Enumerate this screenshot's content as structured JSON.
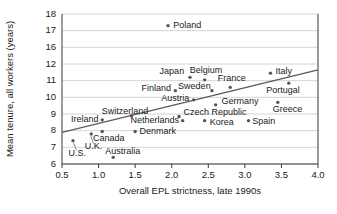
{
  "chart_data": {
    "type": "scatter",
    "title": "",
    "xlabel": "Overall EPL strictness, late 1990s",
    "ylabel": "Mean tenure, all workers (years)",
    "xlim": [
      0.5,
      4.0
    ],
    "xticks": [
      "0.5",
      "1.0",
      "1.5",
      "2.0",
      "2.5",
      "3.0",
      "3.5",
      "4.0"
    ],
    "yticks": [
      "6",
      "7",
      "8",
      "9",
      "10",
      "11",
      "12",
      "16",
      "17",
      "18"
    ],
    "y_axis_break": "between 12 and 16",
    "grid": "horizontal",
    "legend": "none",
    "point_color": "#55555f",
    "trend_color": "#5a5a66",
    "trendline": {
      "x_start": 0.5,
      "y_start": 7.9,
      "x_end": 4.0,
      "y_end": 11.65
    },
    "points": [
      {
        "label": "Poland",
        "x": 1.95,
        "y": 17.3
      },
      {
        "label": "Italy",
        "x": 3.35,
        "y": 11.45
      },
      {
        "label": "Japan",
        "x": 2.25,
        "y": 11.2
      },
      {
        "label": "Belgium",
        "x": 2.45,
        "y": 11.05
      },
      {
        "label": "Portugal",
        "x": 3.6,
        "y": 10.85
      },
      {
        "label": "France",
        "x": 2.8,
        "y": 10.6
      },
      {
        "label": "Sweden",
        "x": 2.55,
        "y": 10.4
      },
      {
        "label": "Finland",
        "x": 2.05,
        "y": 10.4
      },
      {
        "label": "Austria",
        "x": 2.3,
        "y": 9.85
      },
      {
        "label": "Greece",
        "x": 3.45,
        "y": 9.7
      },
      {
        "label": "Germany",
        "x": 2.6,
        "y": 9.55
      },
      {
        "label": "Switzerland",
        "x": 1.45,
        "y": 8.9
      },
      {
        "label": "Czech Republic",
        "x": 2.1,
        "y": 8.85
      },
      {
        "label": "Netherlands",
        "x": 2.15,
        "y": 8.6
      },
      {
        "label": "Ireland",
        "x": 1.05,
        "y": 8.65
      },
      {
        "label": "Korea",
        "x": 2.45,
        "y": 8.6
      },
      {
        "label": "Spain",
        "x": 3.05,
        "y": 8.6
      },
      {
        "label": "Denmark",
        "x": 1.5,
        "y": 7.95
      },
      {
        "label": "Canada",
        "x": 1.05,
        "y": 7.95
      },
      {
        "label": "U.K.",
        "x": 0.9,
        "y": 7.8
      },
      {
        "label": "U.S.",
        "x": 0.65,
        "y": 7.4
      },
      {
        "label": "Australia",
        "x": 1.2,
        "y": 6.4
      }
    ],
    "labels": [
      {
        "text": "Poland",
        "x": 2.02,
        "y": 17.3,
        "anchor": "start"
      },
      {
        "text": "Italy",
        "x": 3.42,
        "y": 11.55,
        "anchor": "start"
      },
      {
        "text": "Japan",
        "x": 2.17,
        "y": 11.55,
        "anchor": "end"
      },
      {
        "text": "Belgium",
        "x": 2.47,
        "y": 11.6,
        "anchor": "middle"
      },
      {
        "text": "France",
        "x": 2.82,
        "y": 11.1,
        "anchor": "middle"
      },
      {
        "text": "Portugal",
        "x": 3.52,
        "y": 10.4,
        "anchor": "middle"
      },
      {
        "text": "Sweden",
        "x": 2.31,
        "y": 10.65,
        "anchor": "middle"
      },
      {
        "text": "Finland",
        "x": 1.99,
        "y": 10.5,
        "anchor": "end"
      },
      {
        "text": "Austria",
        "x": 2.24,
        "y": 9.95,
        "anchor": "end"
      },
      {
        "text": "Germany",
        "x": 2.68,
        "y": 9.75,
        "anchor": "start"
      },
      {
        "text": "Greece",
        "x": 3.38,
        "y": 9.25,
        "anchor": "start"
      },
      {
        "text": "Switzerland",
        "x": 1.36,
        "y": 9.15,
        "anchor": "middle"
      },
      {
        "text": "Czech Republic",
        "x": 2.16,
        "y": 9.1,
        "anchor": "start"
      },
      {
        "text": "Ireland",
        "x": 1.0,
        "y": 8.65,
        "anchor": "end"
      },
      {
        "text": "Netherlands",
        "x": 2.1,
        "y": 8.6,
        "anchor": "end"
      },
      {
        "text": "Korea",
        "x": 2.52,
        "y": 8.5,
        "anchor": "start"
      },
      {
        "text": "Spain",
        "x": 3.1,
        "y": 8.55,
        "anchor": "start"
      },
      {
        "text": "Denmark",
        "x": 1.56,
        "y": 7.95,
        "anchor": "start"
      },
      {
        "text": "Canada",
        "x": 1.14,
        "y": 7.55,
        "anchor": "middle"
      },
      {
        "text": "U.K.",
        "x": 0.93,
        "y": 7.05,
        "anchor": "middle"
      },
      {
        "text": "U.S.",
        "x": 0.71,
        "y": 6.65,
        "anchor": "middle"
      },
      {
        "text": "Australia",
        "x": 1.33,
        "y": 6.75,
        "anchor": "middle"
      }
    ],
    "leader_lines": [
      {
        "from_x": 0.7,
        "from_y": 6.82,
        "to_x": 0.655,
        "to_y": 7.28
      },
      {
        "from_x": 0.93,
        "from_y": 7.22,
        "to_x": 0.895,
        "to_y": 7.68
      }
    ]
  }
}
